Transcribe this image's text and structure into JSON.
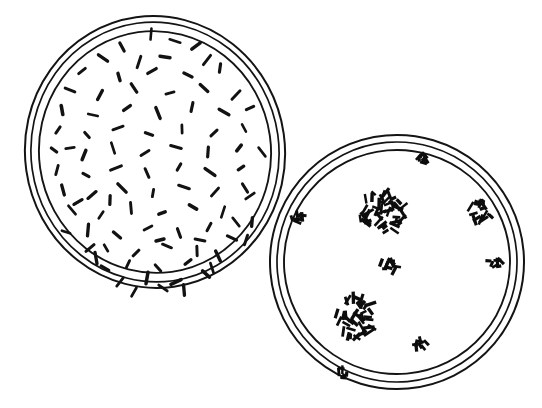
{
  "figure": {
    "background_color": "#ffffff",
    "ink_color": "#141414",
    "width": 542,
    "height": 408
  },
  "left_dish": {
    "label": "Left Petri dish with dispersed bacilli",
    "center": {
      "x": 155,
      "y": 152
    },
    "rims": [
      {
        "name": "outer-rim",
        "rx": 130,
        "ry": 136,
        "rotation": -8,
        "stroke_width": 2.0
      },
      {
        "name": "middle-rim",
        "rx": 124,
        "ry": 130,
        "rotation": -8,
        "stroke_width": 1.7
      },
      {
        "name": "inner-rim",
        "rx": 116,
        "ry": 121,
        "rotation": -8,
        "stroke_width": 1.9
      }
    ],
    "growth_pattern": "dispersed-individual-rods",
    "organism_shape": "bacillus",
    "rod_count": 96,
    "rod_length_px": 9,
    "rod_width_px": 3,
    "rods": [
      [
        151,
        34,
        95
      ],
      [
        122,
        47,
        62
      ],
      [
        175,
        41,
        18
      ],
      [
        196,
        46,
        143
      ],
      [
        103,
        58,
        35
      ],
      [
        139,
        62,
        108
      ],
      [
        165,
        57,
        8
      ],
      [
        207,
        60,
        128
      ],
      [
        82,
        71,
        142
      ],
      [
        119,
        77,
        74
      ],
      [
        152,
        71,
        150
      ],
      [
        188,
        75,
        25
      ],
      [
        220,
        68,
        98
      ],
      [
        70,
        90,
        22
      ],
      [
        100,
        95,
        118
      ],
      [
        134,
        88,
        57
      ],
      [
        170,
        93,
        165
      ],
      [
        204,
        88,
        42
      ],
      [
        236,
        95,
        134
      ],
      [
        62,
        110,
        80
      ],
      [
        93,
        115,
        12
      ],
      [
        127,
        108,
        144
      ],
      [
        158,
        113,
        68
      ],
      [
        192,
        107,
        102
      ],
      [
        224,
        112,
        30
      ],
      [
        250,
        108,
        155
      ],
      [
        58,
        130,
        125
      ],
      [
        87,
        135,
        48
      ],
      [
        118,
        128,
        160
      ],
      [
        149,
        134,
        20
      ],
      [
        182,
        129,
        88
      ],
      [
        214,
        133,
        136
      ],
      [
        244,
        128,
        62
      ],
      [
        54,
        150,
        38
      ],
      [
        84,
        155,
        112
      ],
      [
        113,
        148,
        72
      ],
      [
        145,
        153,
        148
      ],
      [
        176,
        147,
        15
      ],
      [
        208,
        152,
        94
      ],
      [
        239,
        148,
        128
      ],
      [
        262,
        152,
        52
      ],
      [
        57,
        170,
        105
      ],
      [
        86,
        175,
        28
      ],
      [
        116,
        168,
        158
      ],
      [
        147,
        173,
        66
      ],
      [
        179,
        167,
        120
      ],
      [
        210,
        172,
        35
      ],
      [
        241,
        168,
        146
      ],
      [
        63,
        190,
        75
      ],
      [
        92,
        195,
        140
      ],
      [
        122,
        188,
        45
      ],
      [
        153,
        193,
        100
      ],
      [
        184,
        187,
        18
      ],
      [
        215,
        192,
        132
      ],
      [
        245,
        188,
        58
      ],
      [
        72,
        210,
        50
      ],
      [
        101,
        215,
        124
      ],
      [
        131,
        208,
        85
      ],
      [
        162,
        213,
        160
      ],
      [
        193,
        207,
        30
      ],
      [
        223,
        212,
        108
      ],
      [
        88,
        230,
        95
      ],
      [
        117,
        235,
        40
      ],
      [
        148,
        228,
        152
      ],
      [
        179,
        233,
        70
      ],
      [
        209,
        227,
        118
      ],
      [
        106,
        248,
        60
      ],
      [
        136,
        253,
        135
      ],
      [
        167,
        246,
        22
      ],
      [
        197,
        251,
        88
      ],
      [
        128,
        264,
        115
      ],
      [
        158,
        268,
        48
      ],
      [
        188,
        262,
        142
      ],
      [
        96,
        258,
        80
      ],
      [
        218,
        256,
        65
      ],
      [
        105,
        268,
        30
      ],
      [
        147,
        278,
        100
      ],
      [
        176,
        282,
        155
      ],
      [
        206,
        274,
        42
      ],
      [
        120,
        282,
        128
      ],
      [
        90,
        248,
        140
      ],
      [
        232,
        238,
        25
      ],
      [
        252,
        222,
        95
      ],
      [
        250,
        196,
        145
      ],
      [
        66,
        232,
        18
      ],
      [
        78,
        202,
        150
      ],
      [
        246,
        240,
        108
      ],
      [
        212,
        268,
        72
      ],
      [
        163,
        288,
        35
      ],
      [
        134,
        292,
        120
      ],
      [
        184,
        290,
        85
      ],
      [
        236,
        222,
        52
      ],
      [
        200,
        240,
        12
      ],
      [
        160,
        240,
        165
      ],
      [
        110,
        200,
        92
      ],
      [
        70,
        148,
        172
      ]
    ]
  },
  "right_dish": {
    "label": "Right Petri dish with discrete colonies",
    "center": {
      "x": 397,
      "y": 262
    },
    "rims": [
      {
        "name": "outer-rim",
        "rx": 127,
        "ry": 127,
        "rotation": -5,
        "stroke_width": 2.0
      },
      {
        "name": "middle-rim",
        "rx": 120,
        "ry": 120,
        "rotation": -5,
        "stroke_width": 1.7
      },
      {
        "name": "inner-rim",
        "rx": 113,
        "ry": 112,
        "rotation": -5,
        "stroke_width": 1.9
      }
    ],
    "growth_pattern": "discrete-isolated-colonies",
    "colony_count": 8,
    "colonies": [
      {
        "name": "colony-large-upper",
        "x": 382,
        "y": 213,
        "radius": 23,
        "rod_count": 46,
        "size": "large"
      },
      {
        "name": "colony-large-lower",
        "x": 355,
        "y": 317,
        "radius": 22,
        "rod_count": 42,
        "size": "large"
      },
      {
        "name": "colony-medium-right",
        "x": 481,
        "y": 211,
        "radius": 12,
        "rod_count": 16,
        "size": "medium"
      },
      {
        "name": "colony-small-center",
        "x": 388,
        "y": 268,
        "radius": 9,
        "rod_count": 11,
        "size": "small"
      },
      {
        "name": "colony-small-top",
        "x": 420,
        "y": 158,
        "radius": 7,
        "rod_count": 8,
        "size": "small"
      },
      {
        "name": "colony-small-left-edge",
        "x": 298,
        "y": 219,
        "radius": 7,
        "rod_count": 8,
        "size": "small"
      },
      {
        "name": "colony-small-right-edge",
        "x": 494,
        "y": 262,
        "radius": 7,
        "rod_count": 8,
        "size": "small"
      },
      {
        "name": "colony-small-bottom",
        "x": 422,
        "y": 345,
        "radius": 7,
        "rod_count": 8,
        "size": "small"
      },
      {
        "name": "colony-small-rim-bottom",
        "x": 341,
        "y": 373,
        "radius": 6,
        "rod_count": 7,
        "size": "small"
      }
    ]
  }
}
